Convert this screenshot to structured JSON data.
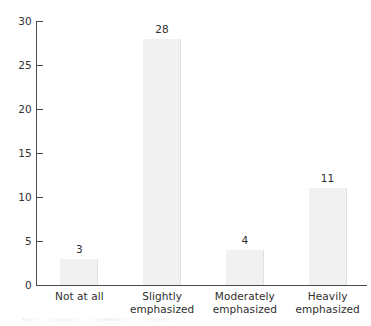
{
  "chart_data": {
    "type": "bar",
    "title": "",
    "subtitle": "",
    "xlabel": "",
    "ylabel": "",
    "categories": [
      "Not at all",
      "Slightly emphasized",
      "Moderately emphasized",
      "Heavily emphasized"
    ],
    "category_lines": [
      [
        "Not at all"
      ],
      [
        "Slightly",
        "emphasized"
      ],
      [
        "Moderately",
        "emphasized"
      ],
      [
        "Heavily",
        "emphasized"
      ]
    ],
    "values": [
      3,
      28,
      4,
      11
    ],
    "value_labels": [
      "3",
      "28",
      "4",
      "11"
    ],
    "ylim": [
      0,
      30
    ],
    "ytick_values": [
      0,
      5,
      10,
      15,
      20,
      25,
      30
    ],
    "ytick_labels": [
      "0",
      "5",
      "10",
      "15",
      "20",
      "25",
      "30"
    ],
    "grid": false,
    "legend": false,
    "legend_position": "none",
    "colors": {
      "bar_fill": "#f1f1f1",
      "bar_edge": "#e0e0e0",
      "axis": "#4a4a4a",
      "text": "#2e2e2e",
      "background": "#ffffff"
    }
  }
}
